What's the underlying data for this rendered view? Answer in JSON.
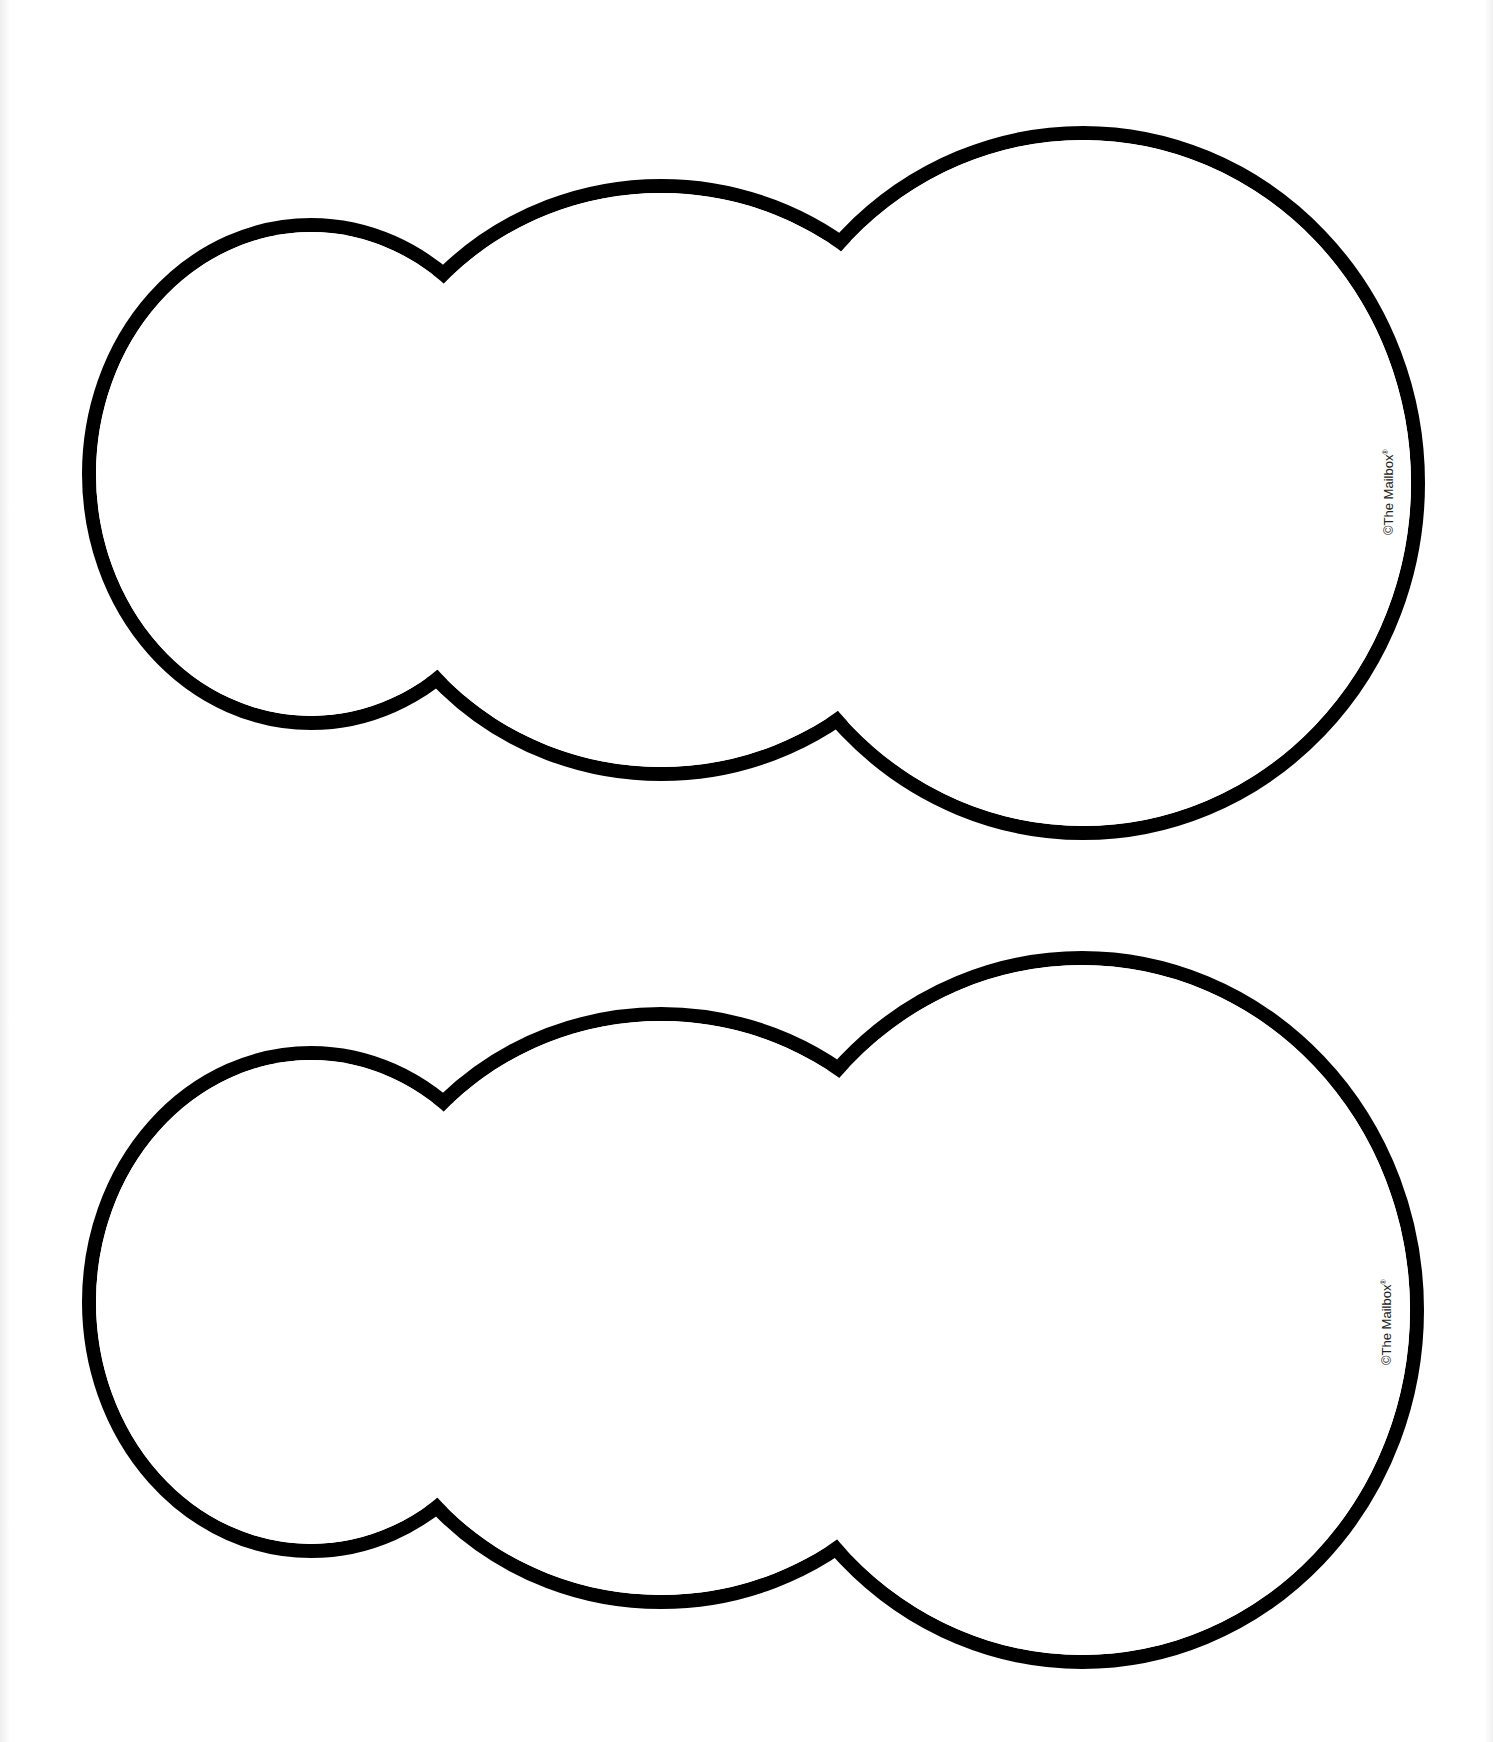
{
  "page": {
    "stroke_color": "#000000",
    "fill_color": "#ffffff"
  },
  "shapes": [
    {
      "name": "snowman-outline-top",
      "copyright": "©The Mailbox",
      "registered": "®"
    },
    {
      "name": "snowman-outline-bottom",
      "copyright": "©The Mailbox",
      "registered": "®"
    }
  ]
}
